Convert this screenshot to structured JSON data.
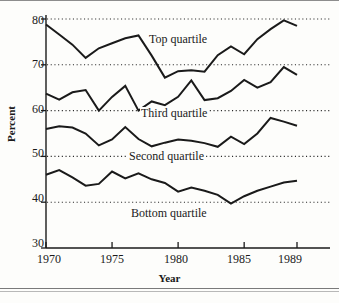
{
  "figure": {
    "axis_title_y": "Percent",
    "axis_title_x": "Year",
    "background": "#fdfdfb",
    "line_color": "#1a1a1a",
    "grid_color": "#2a2a2a"
  },
  "axes": {
    "y_ticks": [
      "80",
      "70",
      "60",
      "50",
      "40",
      "30"
    ],
    "x_ticks": [
      "1970",
      "1975",
      "1980",
      "1985",
      "1989"
    ]
  },
  "labels": {
    "top": "Top quartile",
    "third": "Third quartile",
    "second": "Second quartile",
    "bottom": "Bottom quartile"
  },
  "chart_data": {
    "type": "line",
    "title": "",
    "xlabel": "Year",
    "ylabel": "Percent",
    "xlim": [
      1970,
      1989
    ],
    "ylim": [
      30,
      80
    ],
    "grid": true,
    "grid_orientation": "horizontal",
    "grid_style": "dotted",
    "legend_position": "inline-labels",
    "x": [
      1970,
      1971,
      1972,
      1973,
      1974,
      1975,
      1976,
      1977,
      1978,
      1979,
      1980,
      1981,
      1982,
      1983,
      1984,
      1985,
      1986,
      1987,
      1988,
      1989
    ],
    "xticks": [
      1970,
      1975,
      1980,
      1985,
      1989
    ],
    "yticks": [
      30,
      40,
      50,
      60,
      70,
      80
    ],
    "series": [
      {
        "name": "Top quartile",
        "values": [
          78.8,
          76.6,
          74.4,
          71.5,
          73.6,
          74.7,
          75.8,
          76.4,
          72.0,
          67.2,
          68.6,
          68.8,
          68.5,
          72.1,
          74.0,
          72.3,
          75.6,
          77.8,
          79.7,
          78.5
        ]
      },
      {
        "name": "Third quartile",
        "values": [
          63.7,
          62.4,
          64.0,
          64.5,
          60.0,
          63.0,
          65.4,
          60.0,
          62.0,
          61.2,
          63.0,
          66.6,
          62.3,
          62.7,
          64.3,
          66.7,
          65.0,
          66.2,
          69.5,
          67.8
        ]
      },
      {
        "name": "Second quartile",
        "values": [
          56.0,
          56.6,
          56.3,
          55.0,
          52.4,
          53.7,
          56.4,
          53.8,
          52.2,
          53.0,
          53.7,
          53.4,
          52.9,
          52.1,
          54.3,
          52.7,
          55.0,
          58.4,
          57.6,
          56.7
        ]
      },
      {
        "name": "Bottom quartile",
        "values": [
          46.0,
          47.0,
          45.4,
          43.6,
          44.0,
          46.7,
          45.2,
          46.3,
          45.0,
          44.2,
          42.3,
          43.2,
          42.5,
          41.6,
          39.7,
          41.3,
          42.5,
          43.4,
          44.3,
          44.7
        ]
      }
    ]
  }
}
